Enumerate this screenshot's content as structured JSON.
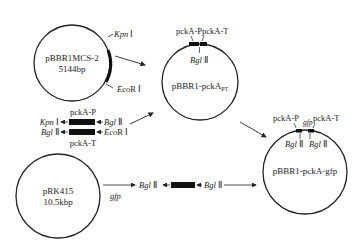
{
  "plasmids": [
    {
      "name": "pBBR1MCS-2",
      "size": "5144bp",
      "sites": [
        "Kpn Ⅰ",
        "EcoR Ⅰ"
      ]
    },
    {
      "name": "pBBR1-pckA",
      "subscript": "PT",
      "features": [
        "pckA-P",
        "pckA-T"
      ],
      "sites": [
        "Bgl Ⅱ"
      ]
    },
    {
      "name": "pRK415",
      "size": "10.5kbp",
      "features": [
        "gfp"
      ]
    },
    {
      "name": "pBBR1-pckA-gfp",
      "features": [
        "pckA-P",
        "gfp",
        "pckA-T"
      ],
      "sites": [
        "Bgl Ⅱ",
        "Bgl Ⅱ"
      ]
    }
  ],
  "fragments": {
    "pckA_P": {
      "label": "pckA-P",
      "left_site": "Kpn Ⅰ",
      "right_site": "Bgl Ⅱ"
    },
    "pckA_T": {
      "label": "pckA-T",
      "left_site": "Bgl Ⅱ",
      "right_site": "EcoR Ⅰ"
    },
    "gfp": {
      "left_site": "Bgl Ⅱ",
      "right_site": "Bgl Ⅱ"
    }
  },
  "labels": {
    "kpn_it": "Kpn",
    "kpn_num": " Ⅰ",
    "eco_it": "Eco",
    "eco_num": "R Ⅰ",
    "bgl_it": "Bgl",
    "bgl_num": " Ⅱ",
    "pckA_P": "pckA-P",
    "pckA_T": "pckA-T",
    "gfp": "gfp",
    "p1_name": "pBBR1MCS-2",
    "p1_size": "5144bp",
    "p2_name": "pBBR1-pckA",
    "p2_sub": "PT",
    "p3_name": "pRK415",
    "p3_size": "10.5kbp",
    "p4_name": "pBBR1-pckA-gfp"
  }
}
